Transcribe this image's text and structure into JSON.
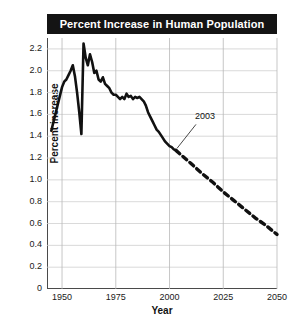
{
  "chart_data": {
    "type": "line",
    "title": "Percent Increase in Human Population",
    "xlabel": "Year",
    "ylabel": "Percent increase",
    "xlim": [
      1943,
      2050
    ],
    "ylim": [
      0,
      2.3
    ],
    "xticks": [
      "1950",
      "1975",
      "2000",
      "2025",
      "2050"
    ],
    "xtick_values": [
      1950,
      1975,
      2000,
      2025,
      2050
    ],
    "yticks": [
      "0",
      "0.2",
      "0.4",
      "0.6",
      "0.8",
      "1.0",
      "1.2",
      "1.4",
      "1.6",
      "1.8",
      "2.0",
      "2.2"
    ],
    "ytick_values": [
      0,
      0.2,
      0.4,
      0.6,
      0.8,
      1.0,
      1.2,
      1.4,
      1.6,
      1.8,
      2.0,
      2.2
    ],
    "grid": true,
    "legend": "none",
    "annotations": [
      {
        "text": "2003",
        "x": 2003,
        "y": 1.27,
        "note": "marks boundary between observed solid line and projected dashed line"
      }
    ],
    "series": [
      {
        "name": "Observed percent increase",
        "style": "solid",
        "color": "#111111",
        "x": [
          1945,
          1950,
          1951,
          1952,
          1953,
          1954,
          1955,
          1956,
          1957,
          1958,
          1959,
          1960,
          1961,
          1962,
          1963,
          1964,
          1965,
          1966,
          1967,
          1968,
          1969,
          1970,
          1971,
          1972,
          1973,
          1974,
          1975,
          1976,
          1977,
          1978,
          1979,
          1980,
          1981,
          1982,
          1983,
          1984,
          1985,
          1986,
          1987,
          1988,
          1989,
          1990,
          1991,
          1992,
          1993,
          1994,
          1995,
          1996,
          1997,
          1998,
          1999,
          2000,
          2001,
          2002,
          2003
        ],
        "y": [
          1.45,
          1.85,
          1.9,
          1.92,
          1.96,
          2.0,
          2.05,
          1.95,
          1.8,
          1.62,
          1.42,
          2.25,
          2.12,
          2.05,
          2.15,
          2.08,
          1.98,
          2.0,
          1.92,
          1.9,
          1.94,
          1.88,
          1.86,
          1.84,
          1.8,
          1.78,
          1.78,
          1.76,
          1.74,
          1.76,
          1.74,
          1.79,
          1.76,
          1.77,
          1.74,
          1.76,
          1.75,
          1.76,
          1.74,
          1.72,
          1.68,
          1.62,
          1.58,
          1.54,
          1.5,
          1.46,
          1.44,
          1.41,
          1.38,
          1.35,
          1.33,
          1.31,
          1.3,
          1.28,
          1.27
        ]
      },
      {
        "name": "Projected percent increase",
        "style": "dashed",
        "color": "#111111",
        "x": [
          2003,
          2010,
          2015,
          2020,
          2025,
          2030,
          2035,
          2040,
          2045,
          2050
        ],
        "y": [
          1.27,
          1.15,
          1.06,
          0.98,
          0.89,
          0.81,
          0.73,
          0.65,
          0.58,
          0.5
        ]
      }
    ]
  }
}
